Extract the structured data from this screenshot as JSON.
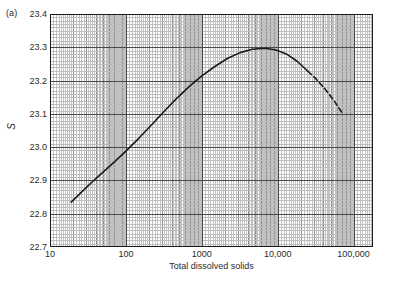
{
  "figure": {
    "panel_label": "(a)",
    "background_color": "#ffffff",
    "frame_color": "#1a1a1a"
  },
  "chart_data": {
    "type": "line",
    "title": "",
    "subtitle": "",
    "panel": "(a)",
    "xlabel": "Total dissolved solids",
    "ylabel": "S",
    "xscale": "log",
    "yscale": "linear",
    "xlim": [
      10,
      180000
    ],
    "ylim": [
      22.7,
      23.4
    ],
    "xticks": [
      10,
      100,
      1000,
      10000,
      100000
    ],
    "xtick_labels": [
      "10",
      "100",
      "1000",
      "10,000",
      "100,000"
    ],
    "yticks": [
      22.7,
      22.8,
      22.9,
      23.0,
      23.1,
      23.2,
      23.3,
      23.4
    ],
    "ytick_labels": [
      "22.7",
      "22.8",
      "22.9",
      "23.0",
      "23.1",
      "23.2",
      "23.3",
      "23.4"
    ],
    "grid": "log-log graph paper, minor gridlines both axes",
    "grid_color": "#9a9a9a",
    "legend": "none",
    "series": [
      {
        "name": "S vs total dissolved solids",
        "linestyle": "solid",
        "color": "#1a1a1a",
        "x": [
          19,
          25,
          35,
          50,
          70,
          100,
          150,
          220,
          320,
          460,
          680,
          1000,
          1500,
          2200,
          3200,
          4600,
          6800,
          9500,
          13000,
          18000,
          25000
        ],
        "y": [
          22.835,
          22.861,
          22.893,
          22.925,
          22.955,
          22.988,
          23.028,
          23.068,
          23.108,
          23.145,
          23.182,
          23.214,
          23.243,
          23.267,
          23.284,
          23.294,
          23.297,
          23.292,
          23.28,
          23.258,
          23.228
        ]
      },
      {
        "name": "S vs total dissolved solids (extrapolated)",
        "linestyle": "dashed",
        "color": "#1a1a1a",
        "x": [
          25000,
          32000,
          42000,
          55000,
          72000
        ],
        "y": [
          23.228,
          23.205,
          23.175,
          23.14,
          23.1
        ]
      }
    ]
  }
}
